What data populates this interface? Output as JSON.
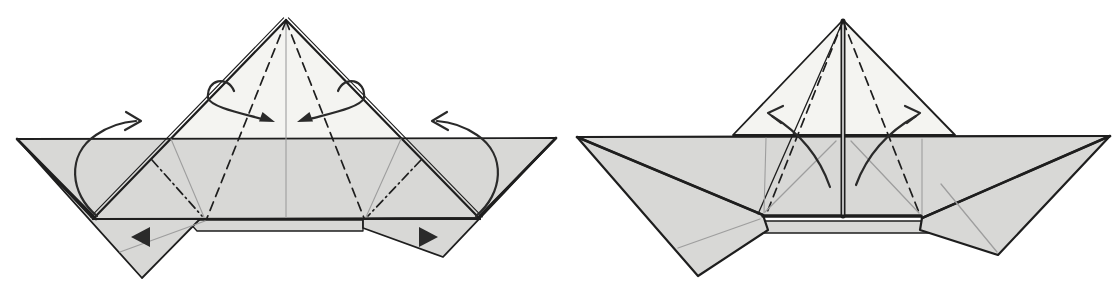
{
  "canvas": {
    "width": 1116,
    "height": 298
  },
  "colors": {
    "background": "#ffffff",
    "paper": "#d8d8d6",
    "paperLight": "#f4f4f1",
    "line": "#1e1e1e",
    "crease": "#9e9e9e",
    "arrow": "#2a2a2a"
  },
  "styles": {
    "outline": {
      "w": 1.8
    },
    "outline2": {
      "w": 2.2
    },
    "thick": {
      "w": 2.6
    },
    "xthick": {
      "w": 3.6
    },
    "spine": {
      "w": 5.0
    },
    "thin": {
      "w": 1.1
    },
    "thinline": {
      "w": 1.3
    },
    "dashed": {
      "w": 1.7,
      "dash": "9 6"
    },
    "dashdot": {
      "w": 1.7,
      "dash": "9 4 1.5 4"
    },
    "crease": {
      "w": 1.1,
      "color": "crease"
    },
    "crease2": {
      "w": 1.3,
      "color": "crease"
    },
    "gap": {
      "w": 1.4,
      "color": "background"
    },
    "arrow": {
      "w": 2.2,
      "color": "arrow"
    }
  },
  "figures": [
    {
      "id": "step-left",
      "elements": [
        {
          "kind": "polygon",
          "name": "main-triangle-face",
          "points": [
            [
              286,
              20
            ],
            [
              93,
              219
            ],
            [
              480,
              219
            ]
          ],
          "fill": "paperLight",
          "stroke": "none"
        },
        {
          "kind": "polygon",
          "name": "body-band-face",
          "points": [
            [
              17,
              139
            ],
            [
              556,
              138
            ],
            [
              478,
              218
            ],
            [
              93,
              219
            ]
          ],
          "fill": "paper",
          "stroke": "outline"
        },
        {
          "kind": "polygon",
          "name": "hull-strip-face",
          "points": [
            [
              187,
              220
            ],
            [
              363,
              220
            ],
            [
              363,
              231
            ],
            [
              197,
              231
            ]
          ],
          "fill": "paper",
          "stroke": "thinline"
        },
        {
          "kind": "polygon",
          "name": "left-wing-flap-face",
          "points": [
            [
              17,
              139
            ],
            [
              93,
              219
            ],
            [
              200,
              219
            ],
            [
              142,
              278
            ]
          ],
          "fill": "paper",
          "stroke": "outline"
        },
        {
          "kind": "polygon",
          "name": "right-wing-flap-face",
          "points": [
            [
              556,
              138
            ],
            [
              478,
              218
            ],
            [
              363,
              219
            ],
            [
              363,
              228
            ],
            [
              443,
              257
            ]
          ],
          "fill": "paper",
          "stroke": "outline"
        },
        {
          "kind": "line",
          "name": "triangle-left-edge",
          "p": [
            286,
            20,
            93,
            219
          ],
          "style": "outline2"
        },
        {
          "kind": "line",
          "name": "triangle-left-edge-layer",
          "p": [
            283.6,
            17.9,
            90.6,
            216.9
          ],
          "style": "thin"
        },
        {
          "kind": "line",
          "name": "triangle-right-edge",
          "p": [
            286,
            20,
            480,
            219
          ],
          "style": "outline2"
        },
        {
          "kind": "line",
          "name": "triangle-right-edge-layer",
          "p": [
            288.4,
            17.9,
            482.4,
            216.9
          ],
          "style": "thin"
        },
        {
          "kind": "line",
          "name": "center-crease",
          "p": [
            286,
            22,
            286,
            218
          ],
          "style": "crease"
        },
        {
          "kind": "line",
          "name": "valley-fold-left",
          "p": [
            286,
            21,
            207,
            218
          ],
          "style": "dashed"
        },
        {
          "kind": "line",
          "name": "valley-fold-right",
          "p": [
            286,
            21,
            364,
            218
          ],
          "style": "dashed"
        },
        {
          "kind": "line",
          "name": "mountain-fold-left",
          "p": [
            152,
            160,
            202,
            216
          ],
          "style": "dashdot"
        },
        {
          "kind": "line",
          "name": "mountain-fold-right",
          "p": [
            421,
            160,
            368,
            216
          ],
          "style": "dashdot"
        },
        {
          "kind": "line",
          "name": "crease-left",
          "p": [
            171,
            139,
            204,
            217
          ],
          "style": "crease"
        },
        {
          "kind": "line",
          "name": "crease-right",
          "p": [
            401,
            139,
            366,
            217
          ],
          "style": "crease"
        },
        {
          "kind": "line",
          "name": "flap-crease-left",
          "p": [
            120,
            252,
            205,
            221
          ],
          "style": "crease2"
        },
        {
          "kind": "line",
          "name": "wing-diagonal-left",
          "p": [
            17,
            139,
            96,
            219
          ],
          "style": "thick"
        },
        {
          "kind": "line",
          "name": "wing-diagonal-right",
          "p": [
            556,
            138,
            478,
            218
          ],
          "style": "thick"
        },
        {
          "kind": "line",
          "name": "band-bottom-edge",
          "p": [
            93,
            219,
            480,
            219
          ],
          "style": "outline2"
        },
        {
          "kind": "path",
          "name": "fold-arrow-top-left",
          "d": "M 234,91 C 228,75 206,79 208,98 C 211,107 240,113 262,119",
          "style": "arrow"
        },
        {
          "kind": "polygon",
          "name": "fold-arrowhead-top-left-icon",
          "points": [
            [
              275,
              122
            ],
            [
              259,
              121.5
            ],
            [
              262.5,
              112
            ]
          ],
          "fill": "arrow",
          "stroke": "none"
        },
        {
          "kind": "path",
          "name": "fold-arrow-top-right",
          "d": "M 338,91 C 344,75 366,79 364,98 C 361,107 332,113 310,119",
          "style": "arrow"
        },
        {
          "kind": "polygon",
          "name": "fold-arrowhead-top-right-icon",
          "points": [
            [
              297,
              122
            ],
            [
              313,
              121.5
            ],
            [
              309.5,
              112
            ]
          ],
          "fill": "arrow",
          "stroke": "none"
        },
        {
          "kind": "path",
          "name": "fold-arrow-side-left",
          "d": "M 97,216 C 70,194 66,155 96,135 C 109,126 122,122 136,121",
          "style": "arrow"
        },
        {
          "kind": "path",
          "name": "fold-arrowhead-side-left-icon",
          "d": "M 126,112 L 141,121 L 125,130",
          "style": "arrow"
        },
        {
          "kind": "path",
          "name": "fold-arrow-side-right",
          "d": "M 476,216 C 503,194 507,155 477,135 C 464,126 451,122 437,121",
          "style": "arrow"
        },
        {
          "kind": "path",
          "name": "fold-arrowhead-side-right-icon",
          "d": "M 447,112 L 432,121 L 448,130",
          "style": "arrow"
        },
        {
          "kind": "polygon",
          "name": "push-arrowhead-left-icon",
          "points": [
            [
              131,
              237
            ],
            [
              150,
              227
            ],
            [
              150,
              247
            ]
          ],
          "fill": "arrow",
          "stroke": "none"
        },
        {
          "kind": "polygon",
          "name": "push-arrowhead-right-icon",
          "points": [
            [
              438,
              237
            ],
            [
              419,
              227
            ],
            [
              419,
              247
            ]
          ],
          "fill": "arrow",
          "stroke": "none"
        }
      ]
    },
    {
      "id": "step-right",
      "elements": [
        {
          "kind": "polygon",
          "name": "peak-triangle-face",
          "points": [
            [
              843,
              20
            ],
            [
              733,
              135
            ],
            [
              955,
              135
            ]
          ],
          "fill": "paperLight",
          "stroke": "outline"
        },
        {
          "kind": "polygon",
          "name": "body-band-face",
          "points": [
            [
              577,
              137
            ],
            [
              1110,
              136
            ],
            [
              922,
              216
            ],
            [
              763,
              216
            ]
          ],
          "fill": "paper",
          "stroke": "none"
        },
        {
          "kind": "polygon",
          "name": "hull-strip-face",
          "points": [
            [
              750,
              221
            ],
            [
              932,
              221
            ],
            [
              938,
              233
            ],
            [
              743,
              233
            ]
          ],
          "fill": "paper",
          "stroke": "thinline"
        },
        {
          "kind": "polygon",
          "name": "left-wing-face",
          "points": [
            [
              577,
              137
            ],
            [
              763,
              215
            ],
            [
              768,
              230
            ],
            [
              698,
              276
            ]
          ],
          "fill": "paper",
          "stroke": "outline2"
        },
        {
          "kind": "polygon",
          "name": "right-wing-face",
          "points": [
            [
              1110,
              136
            ],
            [
              922,
              218
            ],
            [
              920,
              230
            ],
            [
              998,
              255
            ]
          ],
          "fill": "paper",
          "stroke": "outline2"
        },
        {
          "kind": "line",
          "name": "band-top-edge",
          "p": [
            577,
            137,
            1110,
            136
          ],
          "style": "outline2"
        },
        {
          "kind": "line",
          "name": "wing-diagonal-left",
          "p": [
            577,
            137,
            763,
            215
          ],
          "style": "thick"
        },
        {
          "kind": "line",
          "name": "wing-diagonal-right",
          "p": [
            1110,
            136,
            922,
            218
          ],
          "style": "thick"
        },
        {
          "kind": "line",
          "name": "panel-bottom-left",
          "p": [
            763,
            216,
            841,
            216
          ],
          "style": "xthick"
        },
        {
          "kind": "line",
          "name": "panel-bottom-right",
          "p": [
            845,
            216,
            921,
            216
          ],
          "style": "xthick"
        },
        {
          "kind": "line",
          "name": "center-spine",
          "p": [
            843,
            21,
            843,
            216
          ],
          "style": "spine"
        },
        {
          "kind": "line",
          "name": "center-spine-gap",
          "p": [
            843,
            23,
            843,
            214
          ],
          "style": "gap"
        },
        {
          "kind": "line",
          "name": "layer-edge-left",
          "p": [
            843,
            21,
            758,
            214
          ],
          "style": "thinline"
        },
        {
          "kind": "line",
          "name": "valley-fold-left",
          "p": [
            843,
            21,
            766,
            215
          ],
          "style": "dashed"
        },
        {
          "kind": "line",
          "name": "valley-fold-right",
          "p": [
            843,
            21,
            920,
            215
          ],
          "style": "dashed"
        },
        {
          "kind": "line",
          "name": "panel-crease-left",
          "p": [
            766,
            138,
            764,
            213
          ],
          "style": "crease"
        },
        {
          "kind": "line",
          "name": "panel-crease-right",
          "p": [
            922,
            139,
            922,
            214
          ],
          "style": "crease"
        },
        {
          "kind": "line",
          "name": "panel-diagonal-left",
          "p": [
            765,
            212,
            836,
            141
          ],
          "style": "crease2"
        },
        {
          "kind": "line",
          "name": "panel-diagonal-right",
          "p": [
            851,
            141,
            919,
            213
          ],
          "style": "crease2"
        },
        {
          "kind": "line",
          "name": "wing-crease-left",
          "p": [
            678,
            248,
            760,
            219
          ],
          "style": "crease2"
        },
        {
          "kind": "line",
          "name": "wing-crease-right",
          "p": [
            941,
            184,
            997,
            252
          ],
          "style": "crease2"
        },
        {
          "kind": "path",
          "name": "unfold-arrow-left",
          "d": "M 830,187 C 820,158 800,133 772,116",
          "style": "arrow"
        },
        {
          "kind": "path",
          "name": "unfold-arrowhead-left-icon",
          "d": "M 783,106 L 768,113 L 781,123",
          "style": "arrow"
        },
        {
          "kind": "path",
          "name": "unfold-arrow-right",
          "d": "M 856,185 C 866,158 886,133 916,116",
          "style": "arrow"
        },
        {
          "kind": "path",
          "name": "unfold-arrowhead-right-icon",
          "d": "M 905,106 L 920,113 L 907,123",
          "style": "arrow"
        }
      ]
    }
  ]
}
